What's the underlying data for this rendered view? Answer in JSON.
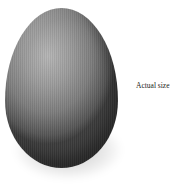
{
  "image": {
    "subject": "egg",
    "caption": "Actual size",
    "colors": {
      "background": "#ffffff",
      "egg_highlight": "#b5b5b5",
      "egg_mid": "#7c7c7c",
      "egg_shadow": "#3c3c3c",
      "caption_text": "#222222"
    }
  }
}
